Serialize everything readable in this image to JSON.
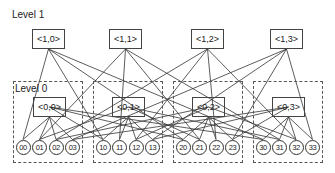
{
  "diagram": {
    "level1_label": "Level 1",
    "level0_label": "Level 0",
    "level1_nodes": [
      {
        "label": "<1,0>",
        "x": 32,
        "y": 29
      },
      {
        "label": "<1,1>",
        "x": 109,
        "y": 29
      },
      {
        "label": "<1,2>",
        "x": 191,
        "y": 29
      },
      {
        "label": "<1,3>",
        "x": 270,
        "y": 29
      }
    ],
    "groups": [
      {
        "x": 13,
        "y": 81,
        "w": 70,
        "h": 82,
        "node": {
          "label": "<0,0>",
          "x": 33,
          "y": 97
        },
        "leaves": [
          "00",
          "01",
          "02",
          "03"
        ]
      },
      {
        "x": 93,
        "y": 81,
        "w": 70,
        "h": 82,
        "node": {
          "label": "<0,1>",
          "x": 112,
          "y": 97
        },
        "leaves": [
          "10",
          "11",
          "12",
          "13"
        ]
      },
      {
        "x": 173,
        "y": 81,
        "w": 70,
        "h": 82,
        "node": {
          "label": "<0,2>",
          "x": 192,
          "y": 97
        },
        "leaves": [
          "20",
          "21",
          "22",
          "23"
        ]
      },
      {
        "x": 253,
        "y": 81,
        "w": 70,
        "h": 82,
        "node": {
          "label": "<0,3>",
          "x": 272,
          "y": 97
        },
        "leaves": [
          "30",
          "31",
          "32",
          "33"
        ]
      }
    ]
  }
}
